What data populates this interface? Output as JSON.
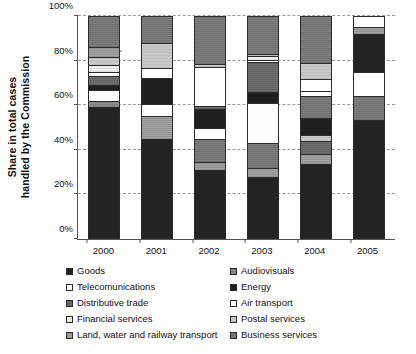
{
  "chart_data": {
    "type": "bar",
    "subtype": "stacked-percentage",
    "title": "",
    "xlabel": "",
    "ylabel": "Share in total cases handled by the Commission",
    "ylabel_lines": [
      "Share in total cases",
      "handled by the Commission"
    ],
    "ylim": [
      0,
      100
    ],
    "yunit": "%",
    "grid": true,
    "grid_axis": "y",
    "legend_position": "bottom",
    "legend_columns": 2,
    "categories": [
      "2000",
      "2001",
      "2002",
      "2003",
      "2004",
      "2005"
    ],
    "ytick_labels": [
      "0%",
      "20%",
      "40%",
      "60%",
      "80%",
      "100%"
    ],
    "ytick_values": [
      0,
      20,
      40,
      60,
      80,
      100
    ],
    "series": [
      {
        "name": "Goods",
        "key": "goods",
        "color": "#232323",
        "values": [
          59.0,
          45.0,
          31.0,
          28.0,
          33.5,
          53.5
        ]
      },
      {
        "name": "Audiovisuals",
        "key": "audiovisuals",
        "color": "#8e8e8e",
        "values": [
          3.0,
          0.0,
          0.0,
          0.0,
          0.0,
          0.0
        ]
      },
      {
        "name": "Telecomunications",
        "key": "telecom",
        "color": "#fdfdfd",
        "values": [
          5.0,
          4.5,
          5.0,
          18.0,
          2.5,
          0.0
        ]
      },
      {
        "name": "Energy",
        "key": "energy",
        "color": "#1f1f1f",
        "values": [
          2.0,
          11.5,
          8.5,
          5.0,
          8.0,
          0.0
        ]
      },
      {
        "name": "Distributive trade",
        "key": "distrib",
        "color": "#6f6f6f",
        "values": [
          4.0,
          0.0,
          1.0,
          13.5,
          6.0,
          0.0
        ]
      },
      {
        "name": "Air transport",
        "key": "air",
        "color": "#ffffff",
        "values": [
          2.0,
          5.5,
          17.5,
          1.0,
          5.5,
          11.0
        ]
      },
      {
        "name": "Financial services",
        "key": "financial",
        "color": "#ededed",
        "values": [
          3.0,
          0.0,
          0.0,
          1.5,
          0.0,
          0.0
        ]
      },
      {
        "name": "Postal services",
        "key": "postal",
        "color": "#c9c9c9",
        "values": [
          3.5,
          11.5,
          1.5,
          1.0,
          9.5,
          0.0
        ]
      },
      {
        "name": "Land, water and railway transport",
        "key": "land",
        "color": "#a5a5a5",
        "values": [
          4.5,
          10.0,
          3.5,
          4.0,
          4.5,
          3.0
        ]
      },
      {
        "name": "Business services",
        "key": "business",
        "color": "#7f7f7f",
        "values": [
          14.0,
          12.0,
          32.0,
          28.0,
          30.5,
          32.5
        ]
      }
    ],
    "stacks": {
      "2000": [
        {
          "name": "Goods",
          "key": "goods",
          "value": 59.0
        },
        {
          "name": "Audiovisuals",
          "key": "audiovisuals",
          "value": 3.0
        },
        {
          "name": "Telecomunications",
          "key": "telecom",
          "value": 5.0
        },
        {
          "name": "Energy",
          "key": "energy",
          "value": 2.0
        },
        {
          "name": "Distributive trade",
          "key": "distrib",
          "value": 4.0
        },
        {
          "name": "Air transport",
          "key": "air",
          "value": 2.0
        },
        {
          "name": "Financial services",
          "key": "financial",
          "value": 3.0
        },
        {
          "name": "Postal services",
          "key": "postal",
          "value": 3.5
        },
        {
          "name": "Land, water and railway transport",
          "key": "land",
          "value": 4.5
        },
        {
          "name": "Business services",
          "key": "business",
          "value": 14.0
        }
      ],
      "2001": [
        {
          "name": "Goods",
          "key": "goods",
          "value": 45.0
        },
        {
          "name": "Land, water and railway transport",
          "key": "land",
          "value": 10.0
        },
        {
          "name": "Air transport",
          "key": "air",
          "value": 5.5
        },
        {
          "name": "Energy",
          "key": "energy",
          "value": 11.5
        },
        {
          "name": "Telecomunications",
          "key": "telecom",
          "value": 4.5
        },
        {
          "name": "Postal services",
          "key": "postal",
          "value": 11.5
        },
        {
          "name": "Business services",
          "key": "business",
          "value": 12.0
        }
      ],
      "2002": [
        {
          "name": "Goods",
          "key": "goods",
          "value": 31.0
        },
        {
          "name": "Land, water and railway transport",
          "key": "land",
          "value": 3.5
        },
        {
          "name": "Business services",
          "key": "business",
          "value": 10.5
        },
        {
          "name": "Telecomunications",
          "key": "telecom",
          "value": 5.0
        },
        {
          "name": "Energy",
          "key": "energy",
          "value": 8.5
        },
        {
          "name": "Distributive trade",
          "key": "distrib",
          "value": 1.0
        },
        {
          "name": "Air transport",
          "key": "air",
          "value": 17.5
        },
        {
          "name": "Postal services",
          "key": "postal",
          "value": 1.5
        },
        {
          "name": "Business services (upper)",
          "key": "business",
          "value": 21.5
        }
      ],
      "2003": [
        {
          "name": "Goods",
          "key": "goods",
          "value": 28.0
        },
        {
          "name": "Land, water and railway transport",
          "key": "land",
          "value": 4.0
        },
        {
          "name": "Business services",
          "key": "business",
          "value": 11.0
        },
        {
          "name": "Telecomunications",
          "key": "telecom",
          "value": 18.0
        },
        {
          "name": "Energy",
          "key": "energy",
          "value": 5.0
        },
        {
          "name": "Distributive trade",
          "key": "distrib",
          "value": 13.5
        },
        {
          "name": "Air transport",
          "key": "air",
          "value": 1.0
        },
        {
          "name": "Financial services",
          "key": "financial",
          "value": 1.5
        },
        {
          "name": "Postal services",
          "key": "postal",
          "value": 1.0
        },
        {
          "name": "Business services (upper)",
          "key": "business",
          "value": 17.0
        }
      ],
      "2004": [
        {
          "name": "Goods",
          "key": "goods",
          "value": 33.5
        },
        {
          "name": "Land, water and railway transport",
          "key": "land",
          "value": 4.5
        },
        {
          "name": "Distributive trade",
          "key": "distrib",
          "value": 6.0
        },
        {
          "name": "Postal services",
          "key": "postal",
          "value": 2.5
        },
        {
          "name": "Energy",
          "key": "energy",
          "value": 8.0
        },
        {
          "name": "Business services",
          "key": "business",
          "value": 9.5
        },
        {
          "name": "Telecomunications",
          "key": "telecom",
          "value": 2.5
        },
        {
          "name": "Air transport",
          "key": "air",
          "value": 5.5
        },
        {
          "name": "Postal services (upper)",
          "key": "postal",
          "value": 7.0
        },
        {
          "name": "Business services (upper)",
          "key": "business",
          "value": 21.0
        }
      ],
      "2005": [
        {
          "name": "Goods",
          "key": "goods",
          "value": 53.5
        },
        {
          "name": "Business services",
          "key": "business",
          "value": 10.5
        },
        {
          "name": "Air transport",
          "key": "air",
          "value": 11.0
        },
        {
          "name": "Goods (upper)",
          "key": "goods",
          "value": 17.0
        },
        {
          "name": "Land, water and railway transport",
          "key": "land",
          "value": 3.0
        },
        {
          "name": "Telecomunications",
          "key": "telecom",
          "value": 5.0
        }
      ]
    }
  },
  "legend": {
    "left_column": [
      {
        "label": "Goods",
        "key": "goods"
      },
      {
        "label": "Telecomunications",
        "key": "telecom"
      },
      {
        "label": "Distributive trade",
        "key": "distrib"
      },
      {
        "label": "Financial services",
        "key": "financial"
      },
      {
        "label": "Land, water and railway transport",
        "key": "land"
      }
    ],
    "right_column": [
      {
        "label": "Audiovisuals",
        "key": "audiovisuals"
      },
      {
        "label": "Energy",
        "key": "energy"
      },
      {
        "label": "Air transport",
        "key": "air"
      },
      {
        "label": "Postal services",
        "key": "postal"
      },
      {
        "label": "Business services",
        "key": "business"
      }
    ]
  }
}
